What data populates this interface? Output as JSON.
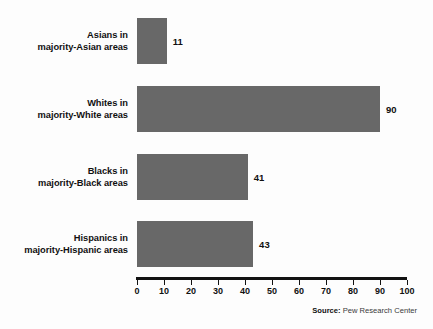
{
  "chart_data": {
    "type": "bar",
    "orientation": "horizontal",
    "title": "",
    "subtitle": "",
    "xlabel": "",
    "ylabel": "",
    "xlim": [
      0,
      100
    ],
    "xticks": [
      0,
      10,
      20,
      30,
      40,
      50,
      60,
      70,
      80,
      90,
      100
    ],
    "xtick_labels": [
      "0",
      "10",
      "20",
      "30",
      "40",
      "50",
      "60",
      "70",
      "80",
      "90",
      "100"
    ],
    "grid": false,
    "legend": null,
    "bar_color": "#686868",
    "axis_color": "#121212",
    "background_color": "#fdfdfd",
    "categories": [
      "Asians in majority-Asian areas",
      "Whites in majority-White areas",
      "Blacks in majority-Black areas",
      "Hispanics in majority-Hispanic areas"
    ],
    "values": [
      11,
      90,
      41,
      43
    ],
    "bars": [
      {
        "label_line1": "Asians in",
        "label_line2": "majority-Asian areas",
        "value": 11,
        "value_label": "11"
      },
      {
        "label_line1": "Whites in",
        "label_line2": "majority-White areas",
        "value": 90,
        "value_label": "90"
      },
      {
        "label_line1": "Blacks in",
        "label_line2": "majority-Black areas",
        "value": 41,
        "value_label": "41"
      },
      {
        "label_line1": "Hispanics in",
        "label_line2": "majority-Hispanic areas",
        "value": 43,
        "value_label": "43"
      }
    ],
    "source_prefix": "Source:",
    "source_text": "Pew Research Center"
  }
}
